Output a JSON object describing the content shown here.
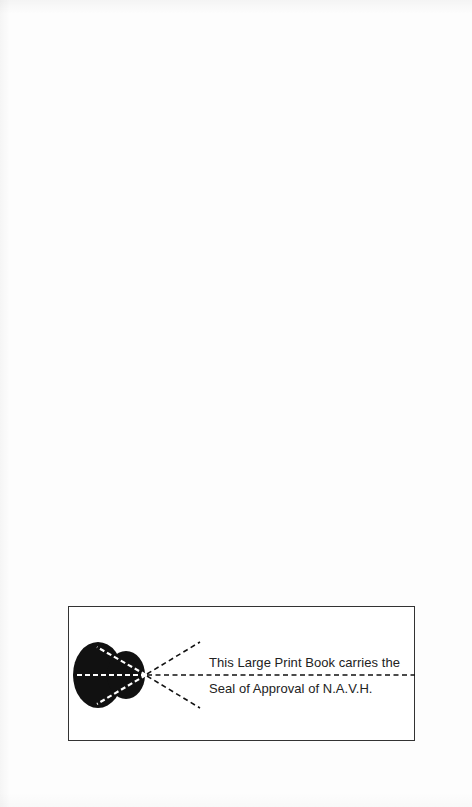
{
  "page": {
    "background": "#fdfdfd"
  },
  "seal": {
    "line_1": "This Large Print Book carries the",
    "line_2": "Seal of  Approval of N.A.V.H.",
    "icon": "eye-icon",
    "border_color": "#333333",
    "ink_color": "#111111"
  }
}
